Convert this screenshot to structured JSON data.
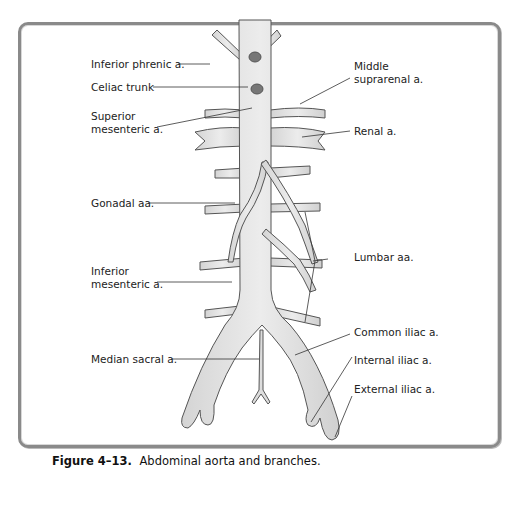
{
  "figure": {
    "caption_number": "Figure 4–13.",
    "caption_text": "Abdominal aorta and branches."
  },
  "labels": {
    "inferior_phrenic": "Inferior phrenic a.",
    "celiac_trunk": "Celiac trunk",
    "superior_mesenteric_1": "Superior",
    "superior_mesenteric_2": "mesenteric a.",
    "middle_suprarenal_1": "Middle",
    "middle_suprarenal_2": "suprarenal a.",
    "renal": "Renal a.",
    "gonadal": "Gonadal aa.",
    "inferior_mesenteric_1": "Inferior",
    "inferior_mesenteric_2": "mesenteric a.",
    "lumbar": "Lumbar aa.",
    "common_iliac": "Common iliac a.",
    "median_sacral": "Median sacral a.",
    "internal_iliac": "Internal iliac a.",
    "external_iliac": "External iliac a."
  },
  "colors": {
    "vessel_fill": "#e6e6e6",
    "vessel_stroke": "#555555",
    "frame": "#8a8a8a"
  }
}
